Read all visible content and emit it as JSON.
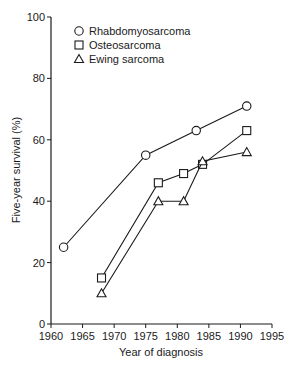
{
  "chart_data": {
    "type": "line",
    "title": "",
    "xlabel": "Year of diagnosis",
    "ylabel": "Five-year survival (%)",
    "xlim": [
      1960,
      1995
    ],
    "ylim": [
      0,
      100
    ],
    "xticks": [
      1960,
      1965,
      1970,
      1975,
      1980,
      1985,
      1990,
      1995
    ],
    "yticks": [
      0,
      20,
      40,
      60,
      80,
      100
    ],
    "grid": false,
    "legend_position": "upper-left inside",
    "series": [
      {
        "name": "Rhabdomyosarcoma",
        "marker": "circle",
        "x": [
          1962,
          1975,
          1983,
          1991
        ],
        "values": [
          25,
          55,
          63,
          71
        ]
      },
      {
        "name": "Osteosarcoma",
        "marker": "square",
        "x": [
          1968,
          1977,
          1981,
          1984,
          1991
        ],
        "values": [
          15,
          46,
          49,
          52,
          63
        ]
      },
      {
        "name": "Ewing sarcoma",
        "marker": "triangle",
        "x": [
          1968,
          1977,
          1981,
          1984,
          1991
        ],
        "values": [
          10,
          40,
          40,
          53,
          56
        ]
      }
    ]
  },
  "legend": {
    "items": [
      {
        "label": "Rhabdomyosarcoma",
        "marker": "circle"
      },
      {
        "label": "Osteosarcoma",
        "marker": "square"
      },
      {
        "label": "Ewing sarcoma",
        "marker": "triangle"
      }
    ]
  },
  "colors": {
    "line": "#1a1a1a",
    "marker_fill": "#ffffff",
    "background": "#ffffff"
  }
}
